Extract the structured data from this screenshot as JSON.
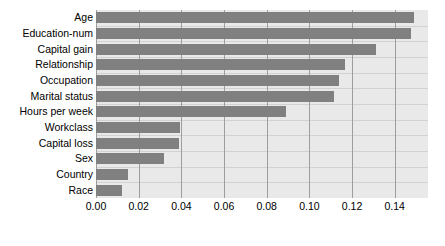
{
  "chart_data": {
    "type": "bar",
    "orientation": "horizontal",
    "title": "",
    "xlabel": "",
    "ylabel": "",
    "xlim": [
      0.0,
      0.1556
    ],
    "grid": true,
    "legend": null,
    "bar_color": "#808080",
    "plot_background": "#e9e9e9",
    "gridline_color": "#9e9e9e",
    "xticks": [
      0.0,
      0.02,
      0.04,
      0.06,
      0.08,
      0.1,
      0.12,
      0.14
    ],
    "xtick_labels": [
      "0.00",
      "0.02",
      "0.04",
      "0.06",
      "0.08",
      "0.10",
      "0.12",
      "0.14"
    ],
    "categories": [
      "Age",
      "Education-num",
      "Capital gain",
      "Relationship",
      "Occupation",
      "Marital status",
      "Hours per week",
      "Workclass",
      "Capital loss",
      "Sex",
      "Country",
      "Race"
    ],
    "values": [
      0.149,
      0.1475,
      0.131,
      0.1165,
      0.114,
      0.1115,
      0.089,
      0.0395,
      0.0388,
      0.0318,
      0.0149,
      0.0121
    ]
  }
}
